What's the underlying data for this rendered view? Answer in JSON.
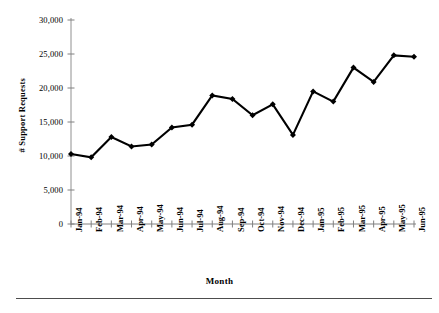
{
  "chart_data": {
    "type": "line",
    "title": "",
    "subtitle": "",
    "xlabel": "Month",
    "ylabel": "# Support Requests",
    "categories": [
      "Jan-94",
      "Feb-94",
      "Mar-94",
      "Apr-94",
      "May-94",
      "Jun-94",
      "Jul-94",
      "Aug-94",
      "Sep-94",
      "Oct-94",
      "Nov-94",
      "Dec-94",
      "Jan-95",
      "Feb-95",
      "Mar-95",
      "Apr-95",
      "May-95",
      "Jun-95"
    ],
    "values": [
      10300,
      9800,
      12800,
      11400,
      11700,
      14200,
      14600,
      18900,
      18400,
      16000,
      17600,
      13100,
      19500,
      18000,
      23000,
      20900,
      24800,
      24600
    ],
    "ylim": [
      0,
      30000
    ],
    "ytick_labels": [
      "0",
      "5,000",
      "10,000",
      "15,000",
      "20,000",
      "25,000",
      "30,000"
    ],
    "ytick_values": [
      0,
      5000,
      10000,
      15000,
      20000,
      25000,
      30000
    ],
    "grid": false,
    "legend": false,
    "legend_position": "none",
    "marker": "diamond",
    "series_color": "#000000",
    "axis_color": "#808080",
    "annotations": []
  },
  "footer": {
    "rule_color": "#4d4d4d"
  }
}
